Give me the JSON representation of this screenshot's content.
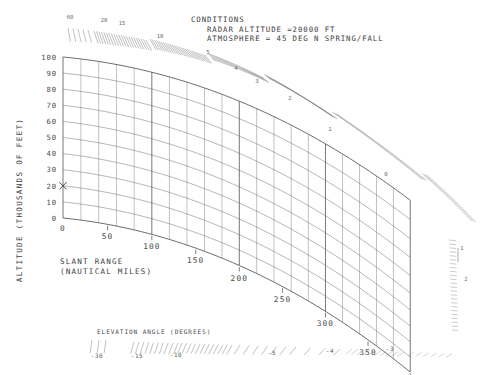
{
  "conditions": {
    "heading": "CONDITIONS",
    "line1": "RADAR ALTITUDE =20000  FT",
    "line2": "ATMOSPHERE = 45 DEG N SPRING/FALL"
  },
  "axes": {
    "y_title": "ALTITUDE (THOUSANDS OF FEET)",
    "x_title_line1": "SLANT RANGE",
    "x_title_line2": "(NAUTICAL MILES)",
    "elevation_title": "ELEVATION ANGLE (DEGREES)"
  },
  "marker": {
    "name": "radar-site-marker",
    "glyph": "×",
    "altitude": 20
  },
  "colors": {
    "grid": "#5a5a5a",
    "border": "#4a4a4a",
    "text": "#3d3d3d",
    "tick": "#7a7a7a"
  },
  "chart_data": {
    "type": "line",
    "xlabel": "SLANT RANGE (NAUTICAL MILES)",
    "ylabel": "ALTITUDE (THOUSANDS OF FEET)",
    "grid": true,
    "legend": "none",
    "xlim": [
      0,
      400
    ],
    "ylim": [
      0,
      100
    ],
    "altitude_ticks": [
      0,
      10,
      20,
      30,
      40,
      50,
      60,
      70,
      80,
      90,
      100
    ],
    "range_ticks": [
      0,
      50,
      100,
      150,
      200,
      250,
      300,
      350,
      400
    ],
    "range_grid_step": 20,
    "elevation_labels_upper": [
      5,
      4,
      3,
      2,
      1,
      0
    ],
    "elevation_labels_top": [
      60,
      20,
      15,
      10
    ],
    "elevation_labels_right": [
      1,
      2
    ],
    "elevation_labels_bottom": [
      -30,
      -15,
      -10,
      -5,
      -4,
      -3
    ],
    "radar_altitude_kft": 20,
    "atmosphere": "45 DEG N SPRING/FALL"
  }
}
